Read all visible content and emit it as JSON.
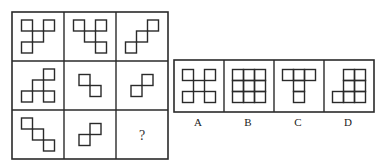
{
  "puzzle": {
    "question_mark": "?",
    "grid": {
      "rows": 3,
      "cols": 3,
      "cells": [
        {
          "row": 0,
          "col": 0,
          "squares": [
            [
              0,
              0
            ],
            [
              2,
              0
            ],
            [
              1,
              1
            ],
            [
              0,
              2
            ]
          ]
        },
        {
          "row": 0,
          "col": 1,
          "squares": [
            [
              0,
              0
            ],
            [
              2,
              0
            ],
            [
              1,
              1
            ],
            [
              2,
              2
            ]
          ]
        },
        {
          "row": 0,
          "col": 2,
          "squares": [
            [
              2,
              0
            ],
            [
              1,
              1
            ],
            [
              0,
              2
            ]
          ]
        },
        {
          "row": 1,
          "col": 0,
          "squares": [
            [
              2,
              0
            ],
            [
              1,
              1
            ],
            [
              0,
              2
            ],
            [
              2,
              2
            ]
          ]
        },
        {
          "row": 1,
          "col": 1,
          "squares": [
            [
              0,
              0
            ],
            [
              1,
              1
            ]
          ]
        },
        {
          "row": 1,
          "col": 2,
          "squares": [
            [
              1,
              0
            ],
            [
              0,
              1
            ]
          ]
        },
        {
          "row": 2,
          "col": 0,
          "squares": [
            [
              0,
              0
            ],
            [
              1,
              1
            ],
            [
              2,
              2
            ]
          ]
        },
        {
          "row": 2,
          "col": 1,
          "squares": [
            [
              1,
              0
            ],
            [
              0,
              1
            ]
          ]
        },
        {
          "row": 2,
          "col": 2,
          "squares": [],
          "missing": true
        }
      ]
    },
    "options": [
      {
        "label": "A",
        "squares": [
          [
            0,
            0
          ],
          [
            2,
            0
          ],
          [
            1,
            1
          ],
          [
            0,
            2
          ],
          [
            2,
            2
          ]
        ]
      },
      {
        "label": "B",
        "squares": [
          [
            0,
            0
          ],
          [
            1,
            0
          ],
          [
            2,
            0
          ],
          [
            0,
            1
          ],
          [
            1,
            1
          ],
          [
            2,
            1
          ],
          [
            0,
            2
          ],
          [
            1,
            2
          ],
          [
            2,
            2
          ]
        ]
      },
      {
        "label": "C",
        "squares": [
          [
            0,
            0
          ],
          [
            1,
            0
          ],
          [
            2,
            0
          ],
          [
            1,
            1
          ],
          [
            1,
            2
          ]
        ]
      },
      {
        "label": "D",
        "squares": [
          [
            1,
            0
          ],
          [
            2,
            0
          ],
          [
            1,
            1
          ],
          [
            2,
            1
          ],
          [
            0,
            2
          ],
          [
            1,
            2
          ],
          [
            2,
            2
          ]
        ]
      }
    ]
  },
  "colors": {
    "line": "#2a2a2a",
    "background": "#ffffff"
  }
}
